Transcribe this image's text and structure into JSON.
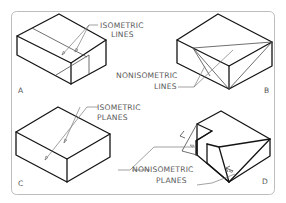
{
  "figure": {
    "type": "isometric-drawing-comparison",
    "panels": [
      {
        "id": "A",
        "label": "A",
        "callout": {
          "line1": "ISOMETRIC",
          "line2": "LINES"
        }
      },
      {
        "id": "B",
        "label": "B",
        "callout": {
          "line1": "NONISOMETRIC",
          "line2": "LINES"
        }
      },
      {
        "id": "C",
        "label": "C",
        "callout": {
          "line1": "ISOMETRIC",
          "line2": "PLANES"
        }
      },
      {
        "id": "D",
        "label": "D",
        "callout": {
          "line1": "NONISOMETRIC",
          "line2": "PLANES"
        }
      }
    ]
  },
  "colors": {
    "frame": "#bdbdbd",
    "edges": "#141414",
    "leaders": "#7a7a7a",
    "text": "#5a5a5a"
  }
}
